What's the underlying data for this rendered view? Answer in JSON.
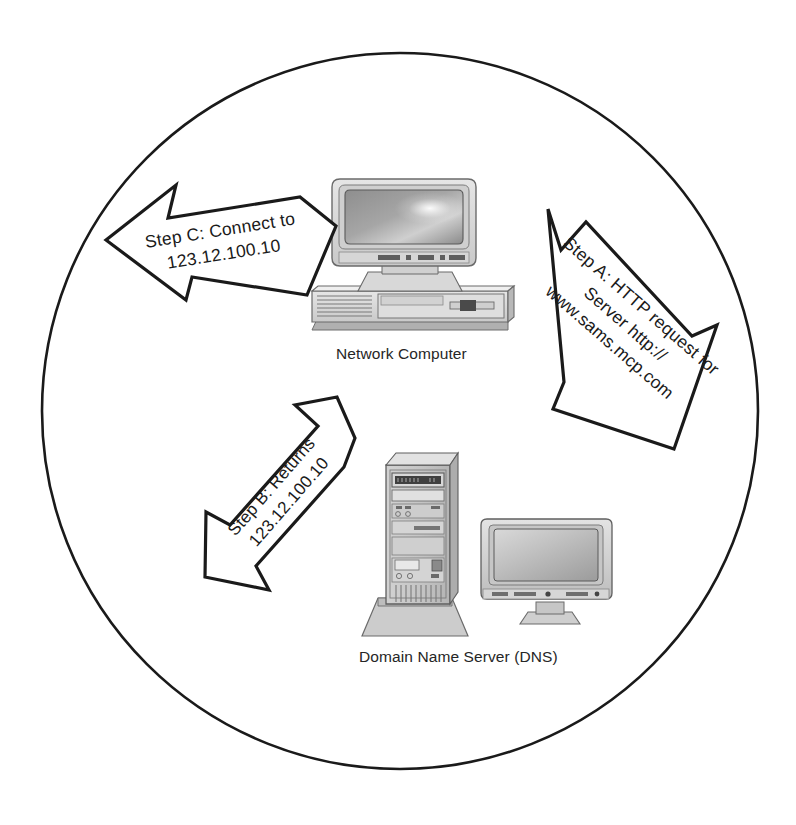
{
  "diagram": {
    "shape": "circle",
    "background_color": "#ffffff",
    "line_color": "#1a1a1a",
    "circle": {
      "cx": 400,
      "cy": 411,
      "r": 358
    },
    "nodes": [
      {
        "id": "network-computer",
        "label": "Network Computer",
        "icon": "desktop-computer-icon",
        "x": 400,
        "y": 255
      },
      {
        "id": "dns-server",
        "label": "Domain Name Server (DNS)",
        "icon": "tower-server-icon",
        "x": 480,
        "y": 540
      }
    ],
    "arrows": [
      {
        "id": "step-a",
        "name": "step-a-arrow",
        "direction": "down-right",
        "from": "network-computer",
        "to": "dns-server",
        "lines": [
          "Step A: HTTP request for",
          "Server http://",
          "www.sams.mcp.com"
        ]
      },
      {
        "id": "step-b",
        "name": "step-b-arrow",
        "direction": "up-right",
        "from": "dns-server",
        "to": "network-computer",
        "lines": [
          "Step B: Returns",
          "123.12.100.10"
        ]
      },
      {
        "id": "step-c",
        "name": "step-c-arrow",
        "direction": "left",
        "from": "network-computer",
        "to": "external",
        "lines": [
          "Step C: Connect to",
          "123.12.100.10"
        ]
      }
    ]
  }
}
